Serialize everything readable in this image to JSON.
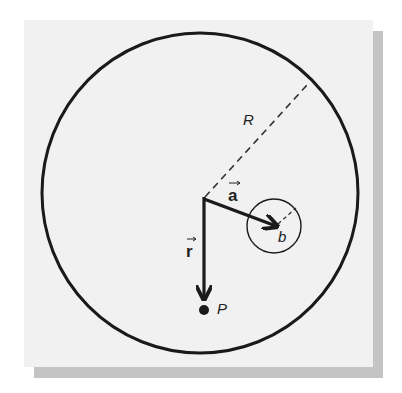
{
  "diagram": {
    "type": "physics-vector-diagram",
    "labels": {
      "big_radius": "R",
      "vector_a": "a",
      "small_radius": "b",
      "vector_r": "r",
      "point": "P"
    },
    "colors": {
      "background": "#f1f1f1",
      "shadow": "#c4c4c4",
      "ink": "#1a1a1a"
    }
  }
}
